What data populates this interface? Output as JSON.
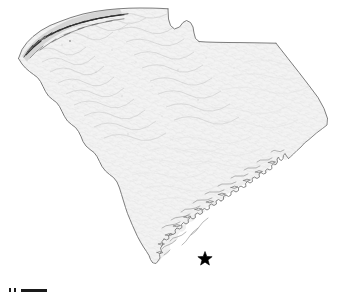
{
  "figure": {
    "type": "shaded-relief-state-map",
    "background_color": "#ffffff",
    "land_fill_color": "#f2f2f2",
    "border_line_color": "#6f6f6f",
    "hillshade_color": "#b9b9b9",
    "mountain_shade_color": "#3c3c3c",
    "coastline_color": "#7a7a7a"
  },
  "markers": [
    {
      "name": "site-location-star",
      "glyph": "star",
      "color": "#000000",
      "x": 205,
      "y": 259,
      "size": 15
    }
  ],
  "scalebar": {
    "label": "",
    "tick_count": 2,
    "bar_color": "#1a1a1a"
  },
  "annotations": {
    "title": "",
    "caption": ""
  }
}
